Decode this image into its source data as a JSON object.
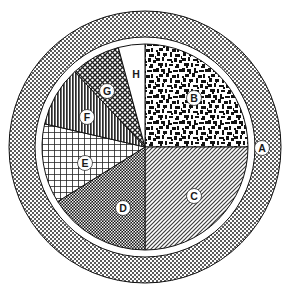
{
  "chart_data": {
    "type": "pie",
    "title": "",
    "subtitle": "",
    "xlabel": "",
    "ylabel": "",
    "legend_position": "none",
    "grid": false,
    "center": {
      "x": 145,
      "y": 147
    },
    "pie_radius": 103,
    "ring_inner_radius": 110,
    "ring_outer_radius": 136,
    "start_angle_deg": 0,
    "direction": "clockwise",
    "categories": [
      "A",
      "B",
      "C",
      "D",
      "E",
      "F",
      "G",
      "H"
    ],
    "values": [
      26,
      90,
      90,
      58,
      45,
      34,
      28,
      15
    ],
    "value_unit": "degrees",
    "slices": [
      {
        "label": "A",
        "role": "outer-ring",
        "angle_deg": 26,
        "fill_pattern": "fine-checkerboard",
        "fill_color": "#a6a6a6",
        "label_x": 262,
        "label_y": 148,
        "label_style": "dark-on-light"
      },
      {
        "label": "B",
        "role": "slice",
        "start_deg": 0,
        "end_deg": 90,
        "angle_deg": 90,
        "fill_pattern": "random-speckle",
        "fill_color": "#4d4d4d",
        "label_x": 194,
        "label_y": 98,
        "label_style": "light-on-dark"
      },
      {
        "label": "C",
        "role": "slice",
        "start_deg": 90,
        "end_deg": 180,
        "angle_deg": 90,
        "fill_pattern": "diagonal-hatch-45",
        "fill_color": "#b5b5b5",
        "label_x": 194,
        "label_y": 196,
        "label_style": "light-on-dark"
      },
      {
        "label": "D",
        "role": "slice",
        "start_deg": 180,
        "end_deg": 238,
        "angle_deg": 58,
        "fill_pattern": "dense-checker",
        "fill_color": "#3a3a3a",
        "label_x": 123,
        "label_y": 208,
        "label_style": "light-on-dark"
      },
      {
        "label": "E",
        "role": "slice",
        "start_deg": 238,
        "end_deg": 283,
        "angle_deg": 45,
        "fill_pattern": "square-grid",
        "fill_color": "#9a9a9a",
        "label_x": 85,
        "label_y": 163,
        "label_style": "light-on-dark"
      },
      {
        "label": "F",
        "role": "slice",
        "start_deg": 283,
        "end_deg": 317,
        "angle_deg": 34,
        "fill_pattern": "vertical-lines",
        "fill_color": "#6f6f6f",
        "label_x": 87,
        "label_y": 117,
        "label_style": "light-on-dark"
      },
      {
        "label": "G",
        "role": "slice",
        "start_deg": 317,
        "end_deg": 345,
        "angle_deg": 28,
        "fill_pattern": "diagonal-crosshatch",
        "fill_color": "#555555",
        "label_x": 107,
        "label_y": 91,
        "label_style": "light-on-dark"
      },
      {
        "label": "H",
        "role": "slice",
        "start_deg": 345,
        "end_deg": 360,
        "angle_deg": 15,
        "fill_pattern": "solid-white",
        "fill_color": "#ffffff",
        "label_x": 136,
        "label_y": 74,
        "label_style": "dark-on-light"
      }
    ],
    "colors": {
      "outline": "#000000",
      "background": "#ffffff",
      "label_text_light": "#ffffff",
      "label_text_dark": "#1a1a1a"
    }
  }
}
